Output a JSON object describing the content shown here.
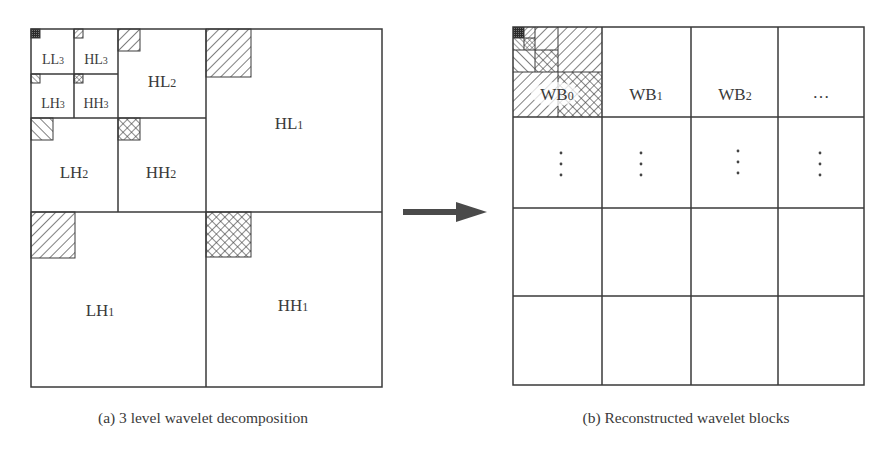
{
  "figure": {
    "panel_a": {
      "caption": "(a) 3 level wavelet decomposition",
      "subbands": [
        {
          "id": "LL3",
          "main": "LL",
          "sub": "3"
        },
        {
          "id": "HL3",
          "main": "HL",
          "sub": "3"
        },
        {
          "id": "LH3",
          "main": "LH",
          "sub": "3"
        },
        {
          "id": "HH3",
          "main": "HH",
          "sub": "3"
        },
        {
          "id": "HL2",
          "main": "HL",
          "sub": "2"
        },
        {
          "id": "LH2",
          "main": "LH",
          "sub": "2"
        },
        {
          "id": "HH2",
          "main": "HH",
          "sub": "2"
        },
        {
          "id": "HL1",
          "main": "HL",
          "sub": "1"
        },
        {
          "id": "LH1",
          "main": "LH",
          "sub": "1"
        },
        {
          "id": "HH1",
          "main": "HH",
          "sub": "1"
        }
      ]
    },
    "arrow": {
      "direction": "right"
    },
    "panel_b": {
      "caption": "(b) Reconstructed wavelet blocks",
      "grid": {
        "rows": 4,
        "cols": 4
      },
      "blocks": [
        {
          "main": "WB",
          "sub": "0"
        },
        {
          "main": "WB",
          "sub": "1"
        },
        {
          "main": "WB",
          "sub": "2"
        },
        {
          "main": "…",
          "sub": ""
        }
      ],
      "row2_marker": "⋮"
    },
    "colors": {
      "line": "#3a3a3a",
      "background": "#ffffff",
      "dark_fill": "#2a2a2a"
    }
  }
}
